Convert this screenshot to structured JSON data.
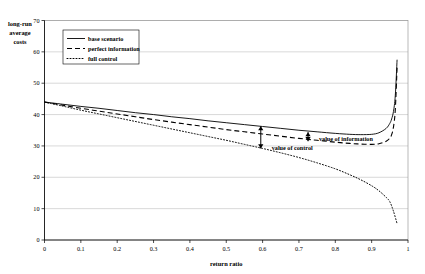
{
  "chart_data": {
    "type": "line",
    "title": "",
    "xlabel": "return ratio",
    "ylabel": "long-run average costs",
    "ylabel_lines": [
      "long-run",
      "average",
      "costs"
    ],
    "xlim": [
      0,
      1
    ],
    "ylim": [
      0,
      70
    ],
    "xticks": [
      "0",
      "0.1",
      "0.2",
      "0.3",
      "0.4",
      "0.5",
      "0.6",
      "0.7",
      "0.8",
      "0.9",
      "1"
    ],
    "xtick_values": [
      0,
      0.1,
      0.2,
      0.3,
      0.4,
      0.5,
      0.6,
      0.7,
      0.8,
      0.9,
      1
    ],
    "yticks": [
      "0",
      "10",
      "20",
      "30",
      "40",
      "50",
      "60",
      "70"
    ],
    "ytick_values": [
      0,
      10,
      20,
      30,
      40,
      50,
      60,
      70
    ],
    "grid": true,
    "grid_axis": "y",
    "legend_position": "upper-left-inside",
    "series": [
      {
        "name": "base scenario",
        "style": "solid",
        "x": [
          0.0,
          0.05,
          0.1,
          0.15,
          0.2,
          0.25,
          0.3,
          0.35,
          0.4,
          0.45,
          0.5,
          0.55,
          0.6,
          0.65,
          0.7,
          0.75,
          0.8,
          0.84,
          0.87,
          0.9,
          0.92,
          0.94,
          0.95,
          0.955,
          0.96,
          0.965,
          0.97
        ],
        "values": [
          44.0,
          43.3,
          42.6,
          42.0,
          41.3,
          40.6,
          40.0,
          39.3,
          38.7,
          38.0,
          37.4,
          36.8,
          36.2,
          35.6,
          35.0,
          34.5,
          34.0,
          33.7,
          33.6,
          33.7,
          34.2,
          35.6,
          37.2,
          38.6,
          41.0,
          46.0,
          57.5
        ]
      },
      {
        "name": "perfect information",
        "style": "dashed",
        "x": [
          0.0,
          0.05,
          0.1,
          0.15,
          0.2,
          0.25,
          0.3,
          0.35,
          0.4,
          0.45,
          0.5,
          0.55,
          0.6,
          0.65,
          0.7,
          0.75,
          0.8,
          0.84,
          0.87,
          0.9,
          0.92,
          0.94,
          0.95,
          0.955,
          0.96,
          0.965,
          0.97
        ],
        "values": [
          44.0,
          43.0,
          42.0,
          41.1,
          40.2,
          39.3,
          38.4,
          37.6,
          36.8,
          36.0,
          35.2,
          34.5,
          33.8,
          33.1,
          32.4,
          31.8,
          31.2,
          30.8,
          30.6,
          30.5,
          30.7,
          31.5,
          32.5,
          33.6,
          36.0,
          41.5,
          55.0
        ]
      },
      {
        "name": "full control",
        "style": "dotted",
        "x": [
          0.0,
          0.05,
          0.1,
          0.15,
          0.2,
          0.25,
          0.3,
          0.35,
          0.4,
          0.45,
          0.5,
          0.55,
          0.6,
          0.65,
          0.7,
          0.75,
          0.8,
          0.84,
          0.87,
          0.9,
          0.92,
          0.94,
          0.95,
          0.96,
          0.97
        ],
        "values": [
          44.0,
          42.7,
          41.4,
          40.2,
          39.0,
          37.8,
          36.6,
          35.4,
          34.2,
          33.0,
          31.8,
          30.5,
          29.2,
          27.8,
          26.3,
          24.6,
          22.7,
          20.8,
          19.2,
          17.3,
          15.7,
          13.6,
          12.2,
          9.2,
          5.2
        ]
      }
    ],
    "annotations": [
      {
        "label": "value of information",
        "x": 0.725,
        "y_top": 34.4,
        "y_bottom": 31.5,
        "label_x": 0.755,
        "label_y": 31.6
      },
      {
        "label": "value of control",
        "x": 0.595,
        "y_top": 36.3,
        "y_bottom": 29.2,
        "label_x": 0.625,
        "label_y": 28.6
      }
    ]
  },
  "colors": {
    "background": "#ffffff",
    "axis": "#000000",
    "grid": "#bfbfbf",
    "series": "#000000",
    "frame": "#9a9a9a"
  }
}
